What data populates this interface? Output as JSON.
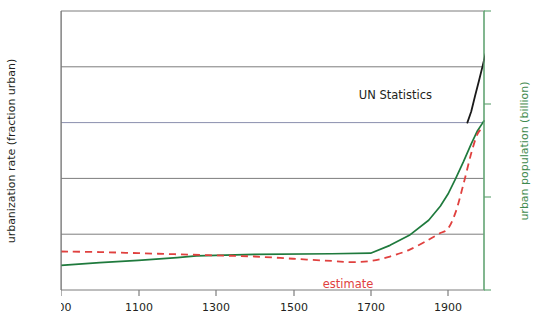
{
  "chart_data": {
    "type": "line",
    "title": "",
    "xlabel": "",
    "ylabel": "urbanization rate (fraction urban)",
    "ylabel_right": "urban population (billion)",
    "xlim": [
      900,
      1993
    ],
    "ylim": [
      0.0,
      0.5
    ],
    "ylim_right": [
      0.01,
      10
    ],
    "yscale_right": "log",
    "grid": true,
    "legend_position": "inline-annotations",
    "xticks": [
      900,
      1100,
      1300,
      1500,
      1700,
      1900
    ],
    "xtick_labels": [
      "900",
      "1100",
      "1300",
      "1500",
      "1700",
      "1900"
    ],
    "yticks": [
      0.0,
      0.1,
      0.2,
      0.3,
      0.4,
      0.5
    ],
    "ytick_labels": [
      "0.00",
      "0.10",
      "0.20",
      "0.30",
      "0.40",
      "0.50"
    ],
    "yticks_right": [
      0.01,
      0.1,
      1,
      10
    ],
    "ytick_labels_right": [
      "0.01",
      "0.1",
      "1",
      "10"
    ],
    "annotations": [
      {
        "text": "UN Statistics",
        "color": "#231f20",
        "x": 1790,
        "y": 0.335
      },
      {
        "text": "estimate",
        "color": "#e0413f",
        "x": 1560,
        "y": 0.018
      }
    ],
    "series": [
      {
        "name": "urbanization rate (solid green)",
        "color": "#1f7a3d",
        "style": "solid",
        "axis": "left",
        "x": [
          900,
          1000,
          1100,
          1200,
          1250,
          1400,
          1600,
          1700,
          1750,
          1800,
          1850,
          1880,
          1900,
          1920,
          1940,
          1960,
          1975,
          1990,
          1993
        ],
        "values": [
          0.044,
          0.049,
          0.053,
          0.058,
          0.061,
          0.064,
          0.065,
          0.066,
          0.08,
          0.098,
          0.125,
          0.15,
          0.172,
          0.2,
          0.23,
          0.262,
          0.284,
          0.3,
          0.303
        ]
      },
      {
        "name": "estimate (dashed red)",
        "color": "#e0413f",
        "style": "dashed",
        "axis": "left",
        "x": [
          900,
          1000,
          1100,
          1200,
          1300,
          1400,
          1500,
          1600,
          1650,
          1700,
          1750,
          1800,
          1850,
          1880,
          1900,
          1920,
          1940,
          1960,
          1975,
          1985,
          1990
        ],
        "values": [
          0.069,
          0.068,
          0.066,
          0.064,
          0.062,
          0.06,
          0.056,
          0.052,
          0.05,
          0.052,
          0.06,
          0.072,
          0.09,
          0.102,
          0.11,
          0.14,
          0.19,
          0.245,
          0.278,
          0.288,
          0.292
        ]
      },
      {
        "name": "UN Statistics (solid black)",
        "color": "#1a1a1a",
        "style": "solid",
        "axis": "left",
        "x": [
          1950,
          1960,
          1970,
          1980,
          1990,
          1993
        ],
        "values": [
          0.3,
          0.32,
          0.348,
          0.375,
          0.403,
          0.412
        ]
      },
      {
        "name": "UN Statistics projection (dashed black)",
        "color": "#1a1a1a",
        "style": "dashed",
        "axis": "left",
        "x": [
          1993,
          2000,
          2010,
          2020
        ],
        "values": [
          0.412,
          0.43,
          0.455,
          0.478
        ]
      }
    ]
  }
}
